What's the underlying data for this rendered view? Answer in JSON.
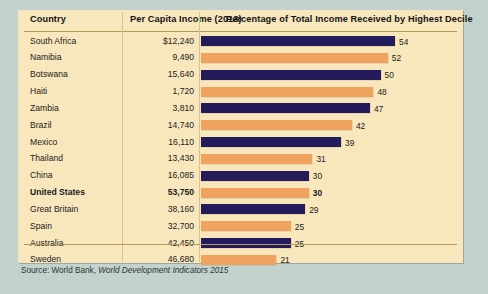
{
  "table": {
    "headers": {
      "country": "Country",
      "income": "Per Capita Income (2013)",
      "percentage": "Percentage of Total Income Received by Highest Decile"
    }
  },
  "source": {
    "prefix": "Source: World Bank, ",
    "italic": "World Development Indicators 2015"
  },
  "colors": {
    "panel_background": "#f8e6bc",
    "page_background": "#c3d2cd",
    "bar_navy": "#231b5c",
    "bar_orange": "#f0a35e",
    "rule": "#b59a5e"
  },
  "chart_data": {
    "type": "bar",
    "title": "Percentage of Total Income Received by Highest Decile",
    "xlabel": "Percentage of Total Income Received by Highest Decile",
    "ylabel": "Country",
    "xlim": [
      0,
      54
    ],
    "grid": false,
    "legend": "none",
    "orientation": "horizontal",
    "categories": [
      "South Africa",
      "Namibia",
      "Botswana",
      "Haiti",
      "Zambia",
      "Brazil",
      "Mexico",
      "Thailand",
      "China",
      "United States",
      "Great Britain",
      "Spain",
      "Australia",
      "Sweden"
    ],
    "values": [
      54,
      52,
      50,
      48,
      47,
      42,
      39,
      31,
      30,
      30,
      29,
      25,
      25,
      21
    ],
    "per_capita_income": [
      "$12,240",
      "9,490",
      "15,640",
      "1,720",
      "3,810",
      "14,740",
      "16,110",
      "13,430",
      "16,085",
      "53,750",
      "38,160",
      "32,700",
      "42,450",
      "46,680"
    ],
    "bar_colors": [
      "navy",
      "orange",
      "navy",
      "orange",
      "navy",
      "orange",
      "navy",
      "orange",
      "navy",
      "orange",
      "navy",
      "orange",
      "navy",
      "orange"
    ],
    "highlight_index": 9,
    "rows": [
      {
        "country": "South Africa",
        "income": "$12,240",
        "value": 54,
        "color": "navy",
        "highlight": false
      },
      {
        "country": "Namibia",
        "income": "9,490",
        "value": 52,
        "color": "orange",
        "highlight": false
      },
      {
        "country": "Botswana",
        "income": "15,640",
        "value": 50,
        "color": "navy",
        "highlight": false
      },
      {
        "country": "Haiti",
        "income": "1,720",
        "value": 48,
        "color": "orange",
        "highlight": false
      },
      {
        "country": "Zambia",
        "income": "3,810",
        "value": 47,
        "color": "navy",
        "highlight": false
      },
      {
        "country": "Brazil",
        "income": "14,740",
        "value": 42,
        "color": "orange",
        "highlight": false
      },
      {
        "country": "Mexico",
        "income": "16,110",
        "value": 39,
        "color": "navy",
        "highlight": false
      },
      {
        "country": "Thailand",
        "income": "13,430",
        "value": 31,
        "color": "orange",
        "highlight": false
      },
      {
        "country": "China",
        "income": "16,085",
        "value": 30,
        "color": "navy",
        "highlight": false
      },
      {
        "country": "United States",
        "income": "53,750",
        "value": 30,
        "color": "orange",
        "highlight": true
      },
      {
        "country": "Great Britain",
        "income": "38,160",
        "value": 29,
        "color": "navy",
        "highlight": false
      },
      {
        "country": "Spain",
        "income": "32,700",
        "value": 25,
        "color": "orange",
        "highlight": false
      },
      {
        "country": "Australia",
        "income": "42,450",
        "value": 25,
        "color": "navy",
        "highlight": false
      },
      {
        "country": "Sweden",
        "income": "46,680",
        "value": 21,
        "color": "orange",
        "highlight": false
      }
    ]
  }
}
